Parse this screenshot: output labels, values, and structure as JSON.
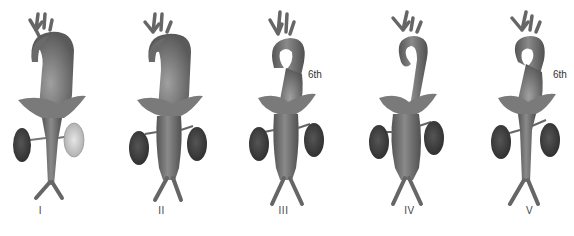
{
  "figures": [
    {
      "label": "I",
      "annotation": null,
      "description": "Branches of aortic arch involved"
    },
    {
      "label": "II",
      "annotation": null,
      "description": "Ascending aorta, arch, descending thoracic and abdominal aorta involved"
    },
    {
      "label": "III",
      "annotation": "6th",
      "description": "Descending thoracic aorta, abdominal aorta and/or renal arteries"
    },
    {
      "label": "IV",
      "annotation": null,
      "description": "Abdominal aorta and/or renal arteries"
    },
    {
      "label": "V",
      "annotation": "6th",
      "description": "Combined features"
    }
  ],
  "colors": {
    "vessel": "#6e6e6e",
    "vessel_dark": "#4a4a4a",
    "vessel_light": "#9a9a9a",
    "kidney": "#3e3e3e",
    "kidney_pale": "#c8c8c8",
    "diaphragm": "#7c7c7c",
    "label": "#444444"
  }
}
